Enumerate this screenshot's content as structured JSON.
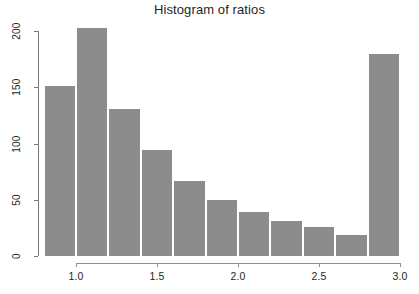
{
  "chart_data": {
    "type": "bar",
    "subtype": "histogram",
    "title": "Histogram of ratios",
    "xlabel": "",
    "ylabel": "",
    "grid": false,
    "legend": null,
    "bin_width": 0.2,
    "bin_edges": [
      0.8,
      1.0,
      1.2,
      1.4,
      1.6,
      1.8,
      2.0,
      2.2,
      2.4,
      2.6,
      2.8,
      3.0
    ],
    "bin_centers": [
      0.9,
      1.1,
      1.3,
      1.5,
      1.7,
      1.9,
      2.1,
      2.3,
      2.5,
      2.7,
      2.9
    ],
    "categories": [
      "0.8-1.0",
      "1.0-1.2",
      "1.2-1.4",
      "1.4-1.6",
      "1.6-1.8",
      "1.8-2.0",
      "2.0-2.2",
      "2.2-2.4",
      "2.4-2.6",
      "2.6-2.8",
      "2.8-3.0"
    ],
    "values": [
      151,
      203,
      131,
      94,
      67,
      50,
      39,
      31,
      26,
      19,
      180
    ],
    "xlim": [
      0.8,
      3.0
    ],
    "ylim": [
      0,
      203
    ],
    "x_ticks": [
      1.0,
      1.5,
      2.0,
      2.5,
      3.0
    ],
    "x_tick_labels": [
      "1.0",
      "1.5",
      "2.0",
      "2.5",
      "3.0"
    ],
    "y_ticks": [
      0,
      50,
      100,
      150,
      200
    ],
    "y_tick_labels": [
      "0",
      "50",
      "100",
      "150",
      "200"
    ],
    "bar_color": "#8c8c8c",
    "bar_border_color": "#ffffff",
    "axis_color": "#7a7a7a",
    "background_color": "#ffffff"
  }
}
